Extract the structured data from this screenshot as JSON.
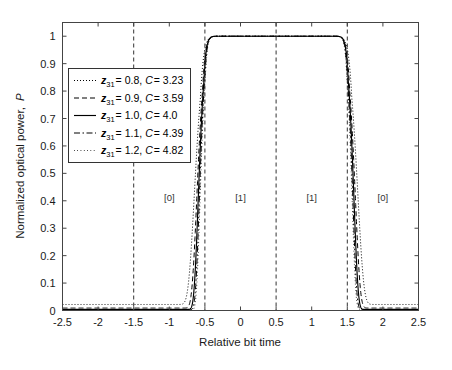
{
  "chart_data": {
    "type": "line",
    "title": "",
    "xlabel": "Relative bit time",
    "ylabel": "Normalized optical power, P",
    "xlim": [
      -2.5,
      2.5
    ],
    "ylim": [
      0,
      1.05
    ],
    "grid": false,
    "legend_position": "upper-left-inside",
    "xticks": [
      -2.5,
      -2,
      -1.5,
      -1,
      -0.5,
      0,
      0.5,
      1,
      1.5,
      2,
      2.5
    ],
    "xticklabels": [
      "-2.5",
      "-2",
      "-1.5",
      "-1",
      "-0.5",
      "0",
      "0.5",
      "1",
      "1.5",
      "2",
      "2.5"
    ],
    "yticks": [
      0,
      0.1,
      0.2,
      0.3,
      0.4,
      0.5,
      0.6,
      0.7,
      0.8,
      0.9,
      1
    ],
    "yticklabels": [
      "0",
      "0.1",
      "0.2",
      "0.3",
      "0.4",
      "0.5",
      "0.6",
      "0.7",
      "0.8",
      "0.9",
      "1"
    ],
    "vertical_markers": [
      -1.5,
      -0.5,
      0.5,
      1.5
    ],
    "bit_annotations": [
      {
        "label": "[0]",
        "x": -1.0,
        "y": 0.4
      },
      {
        "label": "[1]",
        "x": 0.0,
        "y": 0.4
      },
      {
        "label": "[1]",
        "x": 1.0,
        "y": 0.4
      },
      {
        "label": "[0]",
        "x": 2.0,
        "y": 0.4
      }
    ],
    "pulse_centers": [
      0.0,
      1.0
    ],
    "series": [
      {
        "name": "z31-0.8",
        "z31": 0.8,
        "C": 3.23,
        "legend_label": "z_{31} = 0.8, C = 3.23",
        "linestyle": "dotted",
        "dasharray": "1 2",
        "linewidth": 1.0,
        "width": 0.62,
        "order": 7.0,
        "floor": 0.022
      },
      {
        "name": "z31-0.9",
        "z31": 0.9,
        "C": 3.59,
        "legend_label": "z_{31} = 0.9, C = 3.59",
        "linestyle": "dashed",
        "dasharray": "5 3",
        "linewidth": 1.0,
        "width": 0.585,
        "order": 8.0,
        "floor": 0.009
      },
      {
        "name": "z31-1.0",
        "z31": 1.0,
        "C": 4.0,
        "legend_label": "z_{31} = 1.0, C = 4.0",
        "linestyle": "solid",
        "dasharray": "",
        "linewidth": 1.15,
        "width": 0.565,
        "order": 9.0,
        "floor": 0.004
      },
      {
        "name": "z31-1.1",
        "z31": 1.1,
        "C": 4.39,
        "legend_label": "z_{31} = 1.1, C = 4.39",
        "linestyle": "dashdot",
        "dasharray": "6 2.5 1.5 2.5",
        "linewidth": 1.0,
        "width": 0.55,
        "order": 9.5,
        "floor": 0.003
      },
      {
        "name": "z31-1.2",
        "z31": 1.2,
        "C": 4.82,
        "legend_label": "z_{31} = 1.2, C = 4.82",
        "linestyle": "fine-dotted",
        "dasharray": "0.7 2.6",
        "linewidth": 1.0,
        "width": 0.54,
        "order": 10.0,
        "floor": 0.002
      }
    ]
  },
  "legend": {
    "entries": [
      {
        "var": "z",
        "sub": "31",
        "value": "= 0.8,",
        "cvar": "C",
        "cvalue": "= 3.23"
      },
      {
        "var": "z",
        "sub": "31",
        "value": "= 0.9,",
        "cvar": "C",
        "cvalue": "= 3.59"
      },
      {
        "var": "z",
        "sub": "31",
        "value": "= 1.0,",
        "cvar": "C",
        "cvalue": "= 4.0"
      },
      {
        "var": "z",
        "sub": "31",
        "value": "= 1.1,",
        "cvar": "C",
        "cvalue": "= 4.39"
      },
      {
        "var": "z",
        "sub": "31",
        "value": "= 1.2,",
        "cvar": "C",
        "cvalue": "= 4.82"
      }
    ]
  },
  "axis": {
    "ylabel_main": "Normalized optical power,",
    "ylabel_symbol": "P",
    "xlabel": "Relative bit time"
  }
}
